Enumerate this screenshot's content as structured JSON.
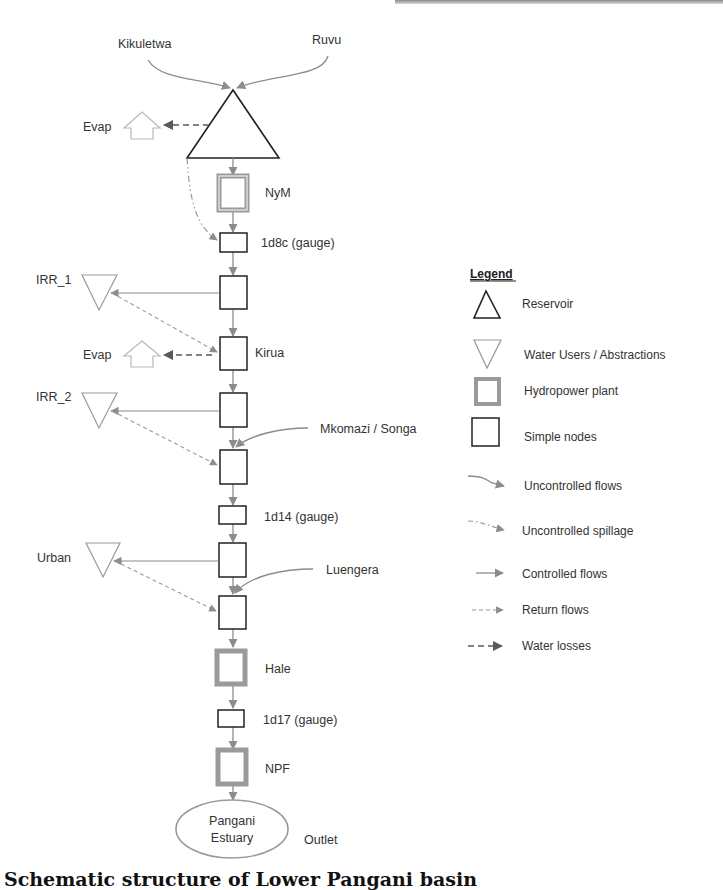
{
  "diagram": {
    "inflows_top": [
      "Kikuletwa",
      "Ruvu"
    ],
    "reservoir_evap_label": "Evap",
    "nodes": {
      "nym": "NyM",
      "gauge_1d8c": "1d8c (gauge)",
      "irr1": "IRR_1",
      "kirua": "Kirua",
      "kirua_evap": "Evap",
      "irr2": "IRR_2",
      "mkomazi_songa": "Mkomazi / Songa",
      "gauge_1d14": "1d14 (gauge)",
      "urban": "Urban",
      "luengera": "Luengera",
      "hale": "Hale",
      "gauge_1d17": "1d17 (gauge)",
      "npf": "NPF",
      "estuary_line1": "Pangani",
      "estuary_line2": "Estuary",
      "outlet": "Outlet"
    }
  },
  "legend": {
    "title": "Legend",
    "items": [
      {
        "symbol": "reservoir-triangle",
        "label": "Reservoir"
      },
      {
        "symbol": "water-user-triangle",
        "label": "Water Users / Abstractions"
      },
      {
        "symbol": "hydropower-square",
        "label": "Hydropower plant"
      },
      {
        "symbol": "simple-node-square",
        "label": "Simple nodes"
      },
      {
        "symbol": "uncontrolled-flow-arrow",
        "label": "Uncontrolled flows"
      },
      {
        "symbol": "uncontrolled-spillage-arrow",
        "label": "Uncontrolled spillage"
      },
      {
        "symbol": "controlled-flow-arrow",
        "label": "Controlled  flows"
      },
      {
        "symbol": "return-flow-arrow",
        "label": "Return flows"
      },
      {
        "symbol": "water-loss-arrow",
        "label": "Water losses"
      }
    ]
  },
  "caption": "Schematic structure of Lower Pangani basin",
  "colors": {
    "node_stroke": "#222222",
    "flow_gray": "#8c8c8c",
    "hydro_gray": "#9a9a9a",
    "user_gray": "#9a9a9a",
    "evap_gray": "#b0b0b0",
    "loss_dark": "#5a5a5a"
  }
}
